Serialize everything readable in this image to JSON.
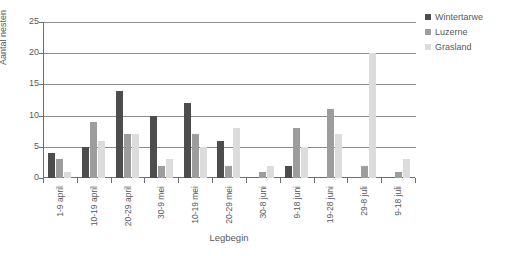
{
  "chart_data": {
    "type": "bar",
    "title": "",
    "xlabel": "Legbegin",
    "ylabel": "Aantal nesten",
    "ylim": [
      0,
      25
    ],
    "yticks": [
      0,
      5,
      10,
      15,
      20,
      25
    ],
    "grid": true,
    "legend_position": "right",
    "categories": [
      "1-9 april",
      "10-19 april",
      "20-29 april",
      "30-9 mei",
      "10-19 mei",
      "20-29 mei",
      "30-8 juni",
      "9-18 juni",
      "19-28 juni",
      "29-8 juli",
      "9-18 juli"
    ],
    "series": [
      {
        "name": "Wintertarwe",
        "color": "#4d4d4d",
        "values": [
          4,
          5,
          14,
          10,
          12,
          6,
          0,
          2,
          0,
          0,
          0
        ]
      },
      {
        "name": "Luzerne",
        "color": "#9d9d9d",
        "values": [
          3,
          9,
          7,
          2,
          7,
          2,
          1,
          8,
          11,
          2,
          1
        ]
      },
      {
        "name": "Grasland",
        "color": "#dcdcdc",
        "values": [
          1,
          6,
          7,
          3,
          5,
          8,
          2,
          5,
          7,
          20,
          3
        ]
      }
    ]
  },
  "legend": {
    "items": [
      {
        "label": "Wintertarwe"
      },
      {
        "label": "Luzerne"
      },
      {
        "label": "Grasland"
      }
    ]
  },
  "axes": {
    "y_title": "Aantal nesten",
    "x_title": "Legbegin",
    "y_tick_labels": [
      "0",
      "5",
      "10",
      "15",
      "20",
      "25"
    ]
  }
}
